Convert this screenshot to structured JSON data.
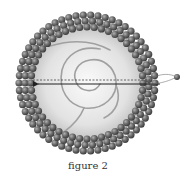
{
  "figure": {
    "caption": "figure 2",
    "colors": {
      "bead": "#5a5a5a",
      "bead_highlight": "#a8a8a8",
      "interior_center": "#fafafa",
      "interior_edge": "#bdbdbd",
      "spiral": "#9a9a9a",
      "arrow": "#222222"
    },
    "elements": [
      {
        "name": "lipid-bilayer-shell",
        "description": "ring of two layers of spheres"
      },
      {
        "name": "aqueous-core",
        "description": "light gray radial gradient interior"
      },
      {
        "name": "spiral-strand",
        "description": "gray coiled strand inside the core"
      },
      {
        "name": "dotted-line",
        "description": "dashed horizontal line through center"
      },
      {
        "name": "arrow",
        "description": "solid horizontal arrow pointing left"
      },
      {
        "name": "small-particle",
        "description": "small sphere outside the shell on the right"
      }
    ]
  }
}
